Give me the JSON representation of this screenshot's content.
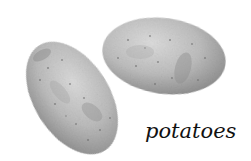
{
  "image": {
    "subject": "two potatoes",
    "caption": "potatoes",
    "colors": {
      "background": "#ffffff",
      "potato_light": "#d8d8d8",
      "potato_mid": "#b4b4b4",
      "potato_dark": "#8a8a8a",
      "caption_text": "#111111"
    }
  },
  "objects": [
    {
      "name": "left-potato",
      "shape": "oval",
      "orientation": "diagonal"
    },
    {
      "name": "right-potato",
      "shape": "oval",
      "orientation": "horizontal"
    }
  ]
}
